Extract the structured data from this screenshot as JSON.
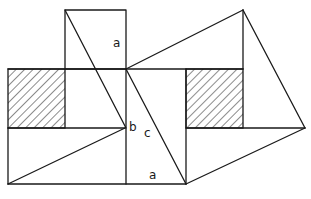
{
  "diagram": {
    "labels": {
      "top_square_side": "a",
      "leg_b": "b",
      "hypotenuse_c": "c",
      "bottom_side": "a"
    },
    "colors": {
      "stroke": "#1a1a1a",
      "background": "#ffffff"
    },
    "shapes": {
      "hatched_squares": 2,
      "triangles": [
        "top-square diagonal",
        "lower-left triangle",
        "right kite"
      ]
    }
  }
}
